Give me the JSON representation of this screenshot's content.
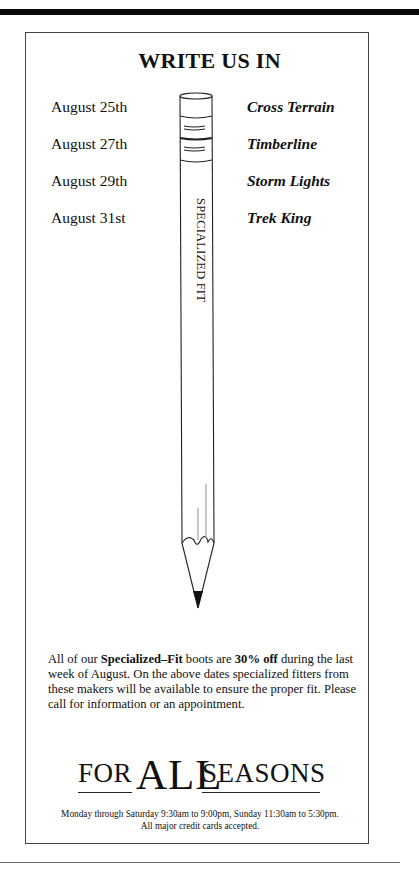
{
  "ad": {
    "title": "WRITE US IN",
    "schedule": [
      {
        "date": "August 25th",
        "maker": "Cross Terrain"
      },
      {
        "date": "August 27th",
        "maker": "Timberline"
      },
      {
        "date": "August 29th",
        "maker": "Storm Lights"
      },
      {
        "date": "August 31st",
        "maker": "Trek King"
      }
    ],
    "pencil_label": "SPECIALIZED FIT",
    "paragraph": {
      "p1": "All of our ",
      "b1": "Specialized–Fit",
      "p2": " boots are ",
      "b2": "30% off",
      "p3": " during the last week of August. On the above dates specialized fitters from these makers will be available to ensure the proper fit. Please call for information or an appointment."
    },
    "logo": {
      "for": "FOR",
      "all": "ALL",
      "seasons": "SEASONS"
    },
    "hours_line1": "Monday through Saturday 9:30am to 9:00pm, Sunday 11:30am to 5:30pm.",
    "hours_line2": "All major credit cards accepted."
  },
  "colors": {
    "ink": "#111111",
    "background": "#ffffff",
    "border": "#444444"
  }
}
